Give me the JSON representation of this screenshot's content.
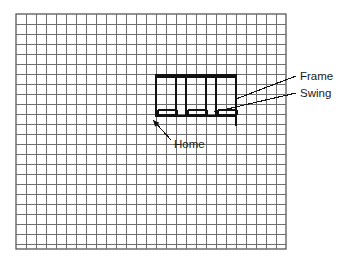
{
  "figure": {
    "background_color": "#ffffff",
    "grid": {
      "x": 16,
      "y": 14,
      "width": 270,
      "height": 235,
      "cell_size": 10,
      "columns": 27,
      "rows": 23.5,
      "line_color": "#6e6e6e",
      "border_color": "#4a4a4a"
    },
    "drawing": {
      "stroke_color": "#111111",
      "frame": {
        "left": 156,
        "right": 236,
        "top": 76,
        "bottom": 116,
        "post_xs": [
          156,
          176,
          186,
          206,
          216,
          236
        ],
        "top_bar_y": 77,
        "bottom_bar_y": 115,
        "right_post_extension_bottom": 126
      },
      "swings": [
        {
          "x": 158,
          "y": 110,
          "width": 19
        },
        {
          "x": 188,
          "y": 110,
          "width": 19
        },
        {
          "x": 218,
          "y": 110,
          "width": 19
        }
      ]
    },
    "annotations": {
      "frame_label": "Frame",
      "swing_label": "Swing",
      "home_label": "Home",
      "frame_leader": {
        "x1": 236,
        "y1": 99,
        "x2": 296,
        "y2": 76
      },
      "swing_leader": {
        "x1": 214,
        "y1": 112,
        "x2": 296,
        "y2": 93
      },
      "home_leader": {
        "x1": 171,
        "y1": 140,
        "x2": 153,
        "y2": 120
      },
      "frame_label_x": 300,
      "frame_label_y": 80,
      "swing_label_x": 300,
      "swing_label_y": 97,
      "home_label_x": 174,
      "home_label_y": 148
    }
  }
}
